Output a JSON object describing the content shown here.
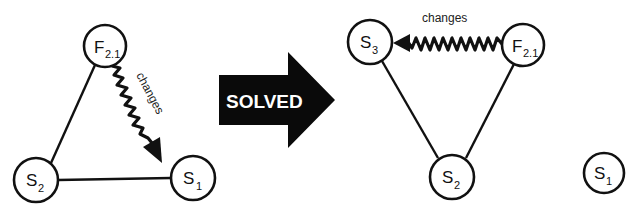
{
  "diagram": {
    "before": {
      "nodes": [
        {
          "id": "F21_before",
          "main": "F",
          "sub": "2.1",
          "cx": 105,
          "cy": 46,
          "r": 21
        },
        {
          "id": "S2_before",
          "main": "S",
          "sub": "2",
          "cx": 36,
          "cy": 180,
          "r": 22
        },
        {
          "id": "S1_before",
          "main": "S",
          "sub": "1",
          "cx": 193,
          "cy": 178,
          "r": 22
        }
      ],
      "edges": [
        {
          "from": "F21_before",
          "to": "S2_before",
          "type": "line"
        },
        {
          "from": "S2_before",
          "to": "S1_before",
          "type": "line"
        },
        {
          "from": "F21_before",
          "to": "S1_before",
          "type": "wavy-arrow",
          "label": "changes"
        }
      ]
    },
    "transition": {
      "label": "SOLVED"
    },
    "after": {
      "nodes": [
        {
          "id": "S3_after",
          "main": "S",
          "sub": "3",
          "cx": 370,
          "cy": 42,
          "r": 22
        },
        {
          "id": "F21_after",
          "main": "F",
          "sub": "2.1",
          "cx": 523,
          "cy": 45,
          "r": 21
        },
        {
          "id": "S2_after",
          "main": "S",
          "sub": "2",
          "cx": 452,
          "cy": 177,
          "r": 22
        },
        {
          "id": "S1_after",
          "main": "S",
          "sub": "1",
          "cx": 604,
          "cy": 173,
          "r": 20
        }
      ],
      "edges": [
        {
          "from": "S3_after",
          "to": "S2_after",
          "type": "line"
        },
        {
          "from": "F21_after",
          "to": "S2_after",
          "type": "line"
        },
        {
          "from": "F21_after",
          "to": "S3_after",
          "type": "wavy-arrow",
          "label": "changes"
        }
      ]
    }
  },
  "labels": {
    "F": "F",
    "S": "S",
    "sub_21": "2.1",
    "sub_1": "1",
    "sub_2": "2",
    "sub_3": "3",
    "changes": "changes",
    "solved": "SOLVED"
  }
}
